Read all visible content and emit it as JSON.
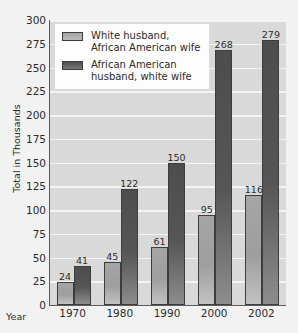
{
  "chart_data": {
    "type": "bar",
    "title": "Between White and African",
    "xlabel": "Year",
    "ylabel": "Total in Thousands",
    "categories": [
      "1970",
      "1980",
      "1990",
      "2000",
      "2002"
    ],
    "series": [
      {
        "name": "White husband,\nAfrican American wife",
        "color": "#a5a5a5",
        "values": [
          24,
          45,
          61,
          95,
          116
        ]
      },
      {
        "name": "African American\nhusband, white wife",
        "color": "#4d4d4d",
        "values": [
          41,
          122,
          150,
          268,
          279
        ]
      }
    ],
    "ylim": [
      0,
      300
    ],
    "yticks": [
      300,
      275,
      250,
      225,
      200,
      175,
      150,
      125,
      100,
      75,
      50,
      25,
      0
    ],
    "grid": true,
    "legend_position": "upper-left",
    "plot_background": "#d9d9d9",
    "figure_background": "#f2f2f2"
  }
}
